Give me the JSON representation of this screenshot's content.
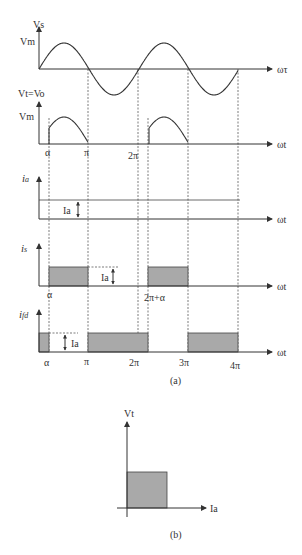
{
  "panel_a": {
    "caption": "(a)",
    "vs": {
      "ylabel": "Vs",
      "peak_label": "Vm",
      "xlabel": "ωτ"
    },
    "vt": {
      "ylabel": "Vt=Vo",
      "peak_label": "Vm",
      "xlabel": "ωt",
      "tick_alpha": "α",
      "tick_pi": "π",
      "tick_2pi": "2π"
    },
    "ia": {
      "ylabel": "i",
      "ylabel_sub": "a",
      "level_label": "Ia",
      "xlabel": "ωt"
    },
    "is": {
      "ylabel": "i",
      "ylabel_sub": "s",
      "level_label": "Ia",
      "xlabel": "ωt",
      "tick_alpha": "α",
      "tick_2pi_alpha": "2π+α"
    },
    "ifd": {
      "ylabel": "i",
      "ylabel_sub": "fd",
      "level_label": "Ia",
      "xlabel": "ωt",
      "ticks": [
        "α",
        "π",
        "2π",
        "3π",
        "4π"
      ]
    }
  },
  "panel_b": {
    "caption": "(b)",
    "ylabel": "Vt",
    "xlabel": "Ia"
  }
}
